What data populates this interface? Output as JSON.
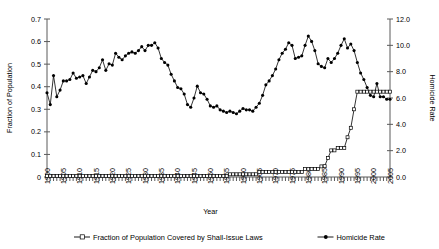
{
  "chart_data": {
    "type": "line",
    "title": "",
    "xlabel": "Year",
    "ylabel": "Fraction of Population",
    "y2label": "Homicide Rate",
    "xlim": [
      1900,
      2005
    ],
    "ylim": [
      0,
      0.7
    ],
    "y2lim": [
      0.0,
      12.0
    ],
    "grid": false,
    "legend_position": "bottom",
    "x_tick_labels": [
      "1900",
      "1905",
      "1910",
      "1915",
      "1920",
      "1925",
      "1930",
      "1935",
      "1940",
      "1945",
      "1950",
      "1955",
      "1960",
      "1965",
      "1970",
      "1975",
      "1980",
      "1985",
      "1990",
      "1995",
      "2000",
      "2005"
    ],
    "y_tick_labels": [
      "0",
      "0.1",
      "0.2",
      "0.3",
      "0.4",
      "0.5",
      "0.6",
      "0.7"
    ],
    "y2_tick_labels": [
      "0.0",
      "2.0",
      "4.0",
      "6.0",
      "8.0",
      "10.0",
      "12.0"
    ],
    "x": [
      1900,
      1901,
      1902,
      1903,
      1904,
      1905,
      1906,
      1907,
      1908,
      1909,
      1910,
      1911,
      1912,
      1913,
      1914,
      1915,
      1916,
      1917,
      1918,
      1919,
      1920,
      1921,
      1922,
      1923,
      1924,
      1925,
      1926,
      1927,
      1928,
      1929,
      1930,
      1931,
      1932,
      1933,
      1934,
      1935,
      1936,
      1937,
      1938,
      1939,
      1940,
      1941,
      1942,
      1943,
      1944,
      1945,
      1946,
      1947,
      1948,
      1949,
      1950,
      1951,
      1952,
      1953,
      1954,
      1955,
      1956,
      1957,
      1958,
      1959,
      1960,
      1961,
      1962,
      1963,
      1964,
      1965,
      1966,
      1967,
      1968,
      1969,
      1970,
      1971,
      1972,
      1973,
      1974,
      1975,
      1976,
      1977,
      1978,
      1979,
      1980,
      1981,
      1982,
      1983,
      1984,
      1985,
      1986,
      1987,
      1988,
      1989,
      1990,
      1991,
      1992,
      1993,
      1994,
      1995,
      1996,
      1997,
      1998,
      1999,
      2000,
      2001,
      2002,
      2003,
      2004,
      2005
    ],
    "series": [
      {
        "name": "Homicide Rate",
        "axis": "right",
        "marker": "filled-diamond",
        "values": [
          6.4,
          5.5,
          7.7,
          6.1,
          6.6,
          7.3,
          7.3,
          7.4,
          7.9,
          7.5,
          7.6,
          7.7,
          7.1,
          7.6,
          8.1,
          8.0,
          8.3,
          8.9,
          8.1,
          8.6,
          8.5,
          9.4,
          9.1,
          8.9,
          9.2,
          9.4,
          9.5,
          9.4,
          9.6,
          9.9,
          9.6,
          10.0,
          10.0,
          10.2,
          9.8,
          9.0,
          8.7,
          8.5,
          7.8,
          7.3,
          6.8,
          6.7,
          6.3,
          5.5,
          5.3,
          6.0,
          6.9,
          6.4,
          6.3,
          5.9,
          5.4,
          5.3,
          5.4,
          5.1,
          5.0,
          4.9,
          5.0,
          4.9,
          4.8,
          5.0,
          5.2,
          5.1,
          5.1,
          5.0,
          5.3,
          5.6,
          6.2,
          7.0,
          7.3,
          7.7,
          8.2,
          8.9,
          9.4,
          9.7,
          10.2,
          10.0,
          9.0,
          9.1,
          9.2,
          10.0,
          10.7,
          10.3,
          9.6,
          8.6,
          8.4,
          8.3,
          9.0,
          8.7,
          9.0,
          9.4,
          10.0,
          10.5,
          9.8,
          10.1,
          9.6,
          8.7,
          7.9,
          7.4,
          6.8,
          6.2,
          6.1,
          7.1,
          6.1,
          6.1,
          5.9,
          5.9
        ]
      },
      {
        "name": "Fraction of Population Covered by Shall-Issue Laws",
        "axis": "left",
        "marker": "open-square",
        "values": [
          0.005,
          0.005,
          0.005,
          0.005,
          0.005,
          0.005,
          0.005,
          0.005,
          0.005,
          0.005,
          0.005,
          0.005,
          0.005,
          0.005,
          0.005,
          0.005,
          0.005,
          0.005,
          0.005,
          0.005,
          0.005,
          0.005,
          0.005,
          0.005,
          0.005,
          0.005,
          0.005,
          0.005,
          0.005,
          0.005,
          0.005,
          0.005,
          0.005,
          0.005,
          0.005,
          0.005,
          0.005,
          0.005,
          0.005,
          0.005,
          0.005,
          0.005,
          0.005,
          0.005,
          0.005,
          0.005,
          0.005,
          0.005,
          0.005,
          0.005,
          0.005,
          0.005,
          0.005,
          0.005,
          0.005,
          0.005,
          0.012,
          0.012,
          0.012,
          0.012,
          0.012,
          0.012,
          0.012,
          0.012,
          0.012,
          0.022,
          0.022,
          0.022,
          0.022,
          0.022,
          0.022,
          0.022,
          0.022,
          0.022,
          0.022,
          0.022,
          0.022,
          0.022,
          0.022,
          0.036,
          0.036,
          0.036,
          0.036,
          0.036,
          0.047,
          0.048,
          0.084,
          0.118,
          0.118,
          0.128,
          0.128,
          0.129,
          0.176,
          0.218,
          0.3,
          0.378,
          0.378,
          0.378,
          0.378,
          0.378,
          0.378,
          0.378,
          0.378,
          0.378,
          0.378,
          0.378
        ]
      }
    ],
    "legend": [
      {
        "label": "Fraction of Population Covered by Shall-Issue Laws",
        "marker": "open-square"
      },
      {
        "label": "Homicide Rate",
        "marker": "filled-diamond"
      }
    ]
  },
  "colors": {
    "axis": "#5a5a5a",
    "line": "#000000",
    "background": "#ffffff"
  }
}
